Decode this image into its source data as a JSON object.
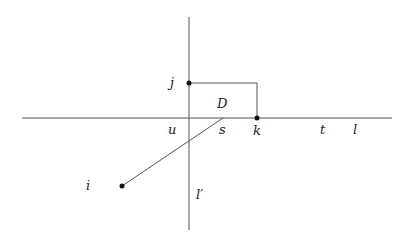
{
  "diagram": {
    "lines": [
      {
        "name": "l",
        "x1": 22,
        "y1": 118,
        "x2": 392,
        "y2": 118
      },
      {
        "name": "l_prime",
        "x1": 189,
        "y1": 17,
        "x2": 189,
        "y2": 230
      },
      {
        "name": "segment-i-s",
        "x1": 122,
        "y1": 186,
        "x2": 223,
        "y2": 118
      }
    ],
    "rectangle": {
      "x1": 189,
      "y1": 83,
      "x2": 257,
      "y2": 118
    },
    "points": [
      {
        "name": "j",
        "x": 189,
        "y": 83
      },
      {
        "name": "k",
        "x": 257,
        "y": 118
      },
      {
        "name": "i",
        "x": 122,
        "y": 186
      }
    ],
    "labels": {
      "j": "j",
      "D": "D",
      "u": "u",
      "s": "s",
      "k": "k",
      "t": "t",
      "l": "l",
      "i": "i",
      "l_prime": "l′"
    },
    "colors": {
      "line": "#555555",
      "point": "#111111",
      "text": "#222222"
    }
  }
}
